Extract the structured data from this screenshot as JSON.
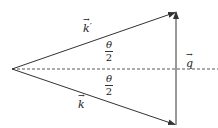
{
  "diagram": {
    "colors": {
      "line": "#333333",
      "dashed_axis": "#444444",
      "background": "#ffffff"
    },
    "labels": {
      "k_prime": "k",
      "k_prime_mark": "′",
      "k": "k",
      "q": "q",
      "theta_upper_num": "θ",
      "theta_upper_den": "2",
      "theta_lower_num": "θ",
      "theta_lower_den": "2"
    },
    "geometry": {
      "origin": [
        12,
        69
      ],
      "top_vertex": [
        176,
        12
      ],
      "bottom_vertex": [
        176,
        125
      ],
      "axis_end_x": 218
    }
  }
}
